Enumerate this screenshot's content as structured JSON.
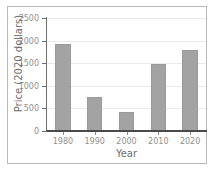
{
  "chart_data": {
    "type": "bar",
    "title": "",
    "xlabel": "Year",
    "ylabel": "Price (2020 dollars)",
    "categories": [
      "1980",
      "1990",
      "2000",
      "2010",
      "2020"
    ],
    "values": [
      1930,
      760,
      420,
      1480,
      1790
    ],
    "ylim": [
      0,
      2500
    ],
    "yticks": [
      "0",
      "500",
      "1000",
      "1500",
      "2000",
      "2500"
    ],
    "ytick_values": [
      0,
      500,
      1000,
      1500,
      2000,
      2500
    ],
    "grid": true,
    "legend": "none",
    "bar_color": "#a3a3a3",
    "axis_color": "#6e6e6e",
    "tick_label_color": "#8f8f8f",
    "axis_title_color": "#6d6d6d",
    "frame_color": "#b9b9b9",
    "background_color": "#ffffff"
  }
}
